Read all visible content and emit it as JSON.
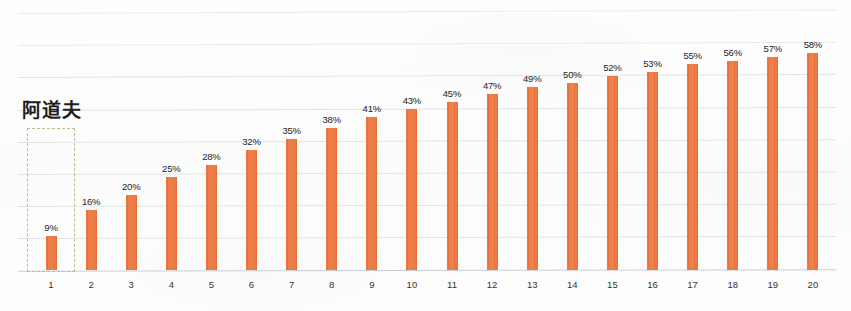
{
  "chart_data": {
    "type": "bar",
    "title": "",
    "subtitle": "",
    "xlabel": "",
    "ylabel": "",
    "categories": [
      "1",
      "2",
      "3",
      "4",
      "5",
      "6",
      "7",
      "8",
      "9",
      "10",
      "11",
      "12",
      "13",
      "14",
      "15",
      "16",
      "17",
      "18",
      "19",
      "20"
    ],
    "values": [
      9,
      16,
      20,
      25,
      28,
      32,
      35,
      38,
      41,
      43,
      45,
      47,
      49,
      50,
      52,
      53,
      55,
      56,
      57,
      58
    ],
    "data_labels": [
      "9%",
      "16%",
      "20%",
      "25%",
      "28%",
      "32%",
      "35%",
      "38%",
      "41%",
      "43%",
      "45%",
      "47%",
      "49%",
      "50%",
      "52%",
      "53%",
      "55%",
      "56%",
      "57%",
      "58%"
    ],
    "value_unit": "%",
    "ylim": [
      0,
      72
    ],
    "xlim_categories": 20,
    "grid": true,
    "gridline_count": 8,
    "legend": "none",
    "legend_position": "none",
    "series": [
      {
        "name": "阿道夫",
        "color": "#e86a30",
        "values": [
          9,
          16,
          20,
          25,
          28,
          32,
          35,
          38,
          41,
          43,
          45,
          47,
          49,
          50,
          52,
          53,
          55,
          56,
          57,
          58
        ]
      }
    ],
    "annotations": [
      {
        "name": "highlight-box",
        "label": "阿道夫",
        "target_category": "1",
        "target_value": 9,
        "style": "dashed-rectangle",
        "color": "#b6c28c"
      }
    ]
  },
  "annotation_label": {
    "text": "阿道夫"
  },
  "colors": {
    "bar": "#e86a30",
    "bar_highlight": "#ef7b42",
    "gridline": "#dfe3e8",
    "axis": "#c9ced4",
    "highlight_dash": "#b6c28c",
    "label_text": "#2b2b2b",
    "tick_text": "#333333",
    "background": "#fdfdfd"
  }
}
